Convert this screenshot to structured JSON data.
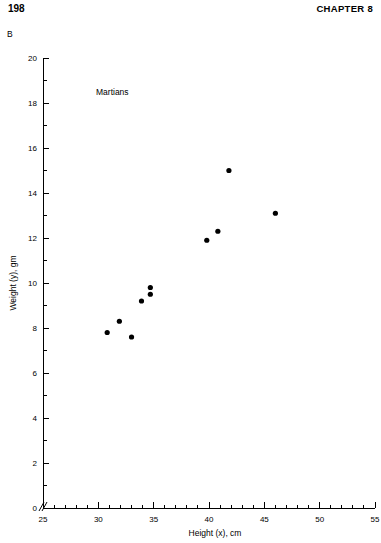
{
  "page": {
    "number": "198",
    "chapter": "CHAPTER 8",
    "panel_letter": "B"
  },
  "figure": {
    "annotation": "Martians",
    "point_color": "#000000",
    "axis_color": "#000000"
  },
  "chart_data": {
    "type": "scatter",
    "title": "",
    "annotation": "Martians",
    "xlabel": "Height (x), cm",
    "ylabel": "Weight (y), gm",
    "xlim": [
      25,
      55
    ],
    "ylim": [
      0,
      20
    ],
    "x_major_ticks": [
      25,
      30,
      35,
      40,
      45,
      50,
      55
    ],
    "x_minor_tick_interval": 1,
    "y_major_ticks": [
      0,
      2,
      4,
      6,
      8,
      10,
      12,
      14,
      16,
      18,
      20
    ],
    "y_minor_tick_interval": 1,
    "axis_break_at_origin": true,
    "grid": false,
    "legend": false,
    "series": [
      {
        "name": "Martians",
        "x": [
          30.8,
          31.9,
          33.0,
          33.9,
          34.7,
          34.7,
          39.8,
          40.8,
          41.8,
          46.0
        ],
        "y": [
          7.8,
          8.3,
          7.6,
          9.2,
          9.8,
          9.5,
          11.9,
          12.3,
          15.0,
          13.1
        ]
      }
    ],
    "points": [
      {
        "x": 30.8,
        "y": 7.8
      },
      {
        "x": 31.9,
        "y": 8.3
      },
      {
        "x": 33.0,
        "y": 7.6
      },
      {
        "x": 33.9,
        "y": 9.2
      },
      {
        "x": 34.7,
        "y": 9.8
      },
      {
        "x": 34.7,
        "y": 9.5
      },
      {
        "x": 39.8,
        "y": 11.9
      },
      {
        "x": 40.8,
        "y": 12.3
      },
      {
        "x": 41.8,
        "y": 15.0
      },
      {
        "x": 46.0,
        "y": 13.1
      }
    ]
  }
}
